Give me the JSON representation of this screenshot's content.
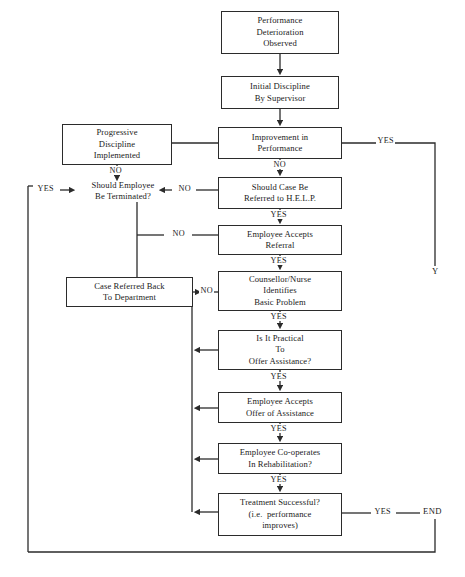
{
  "diagram": {
    "line_color": "#2b2b2b",
    "text_color": "#1a1a1a",
    "background": "#ffffff"
  },
  "nodes": [
    {
      "id": "performance-deterioration-observed",
      "lines": [
        "Performance",
        "Deterioration",
        "Observed"
      ],
      "x": 221,
      "y": 11,
      "w": 118,
      "h": 43,
      "boxed": true
    },
    {
      "id": "initial-discipline-by-supervisor",
      "lines": [
        "Initial Discipline",
        "By Supervisor"
      ],
      "x": 221,
      "y": 76,
      "w": 118,
      "h": 33,
      "boxed": true
    },
    {
      "id": "improvement-in-performance",
      "lines": [
        "Improvement in",
        "Performance"
      ],
      "x": 218,
      "y": 127,
      "w": 124,
      "h": 32,
      "boxed": true
    },
    {
      "id": "progressive-discipline-implemented",
      "lines": [
        "Progressive",
        "Discipline",
        "Implemented"
      ],
      "x": 62,
      "y": 124,
      "w": 110,
      "h": 41,
      "boxed": true
    },
    {
      "id": "should-employee-be-terminated",
      "lines": [
        "Should Employee",
        "Be Terminated?"
      ],
      "x": 73,
      "y": 180,
      "w": 100,
      "h": 22,
      "boxed": false
    },
    {
      "id": "should-case-be-referred-to-help",
      "lines": [
        "Should Case Be",
        "Referred to H.E.L.P."
      ],
      "x": 218,
      "y": 177,
      "w": 124,
      "h": 32,
      "boxed": true
    },
    {
      "id": "employee-accepts-referral",
      "lines": [
        "Employee Accepts",
        "Referral"
      ],
      "x": 218,
      "y": 225,
      "w": 124,
      "h": 30,
      "boxed": true
    },
    {
      "id": "counsellor-nurse-identifies-basic-problem",
      "lines": [
        "Counsellor/Nurse",
        "Identifies",
        "Basic Problem"
      ],
      "x": 218,
      "y": 271,
      "w": 124,
      "h": 40,
      "boxed": true
    },
    {
      "id": "case-referred-back-to-department",
      "lines": [
        "Case Referred Back",
        "To Department"
      ],
      "x": 66,
      "y": 277,
      "w": 127,
      "h": 30,
      "boxed": true
    },
    {
      "id": "is-it-practical-to-offer-assistance",
      "lines": [
        "Is It Practical",
        "To",
        "Offer Assistance?"
      ],
      "x": 218,
      "y": 330,
      "w": 124,
      "h": 40,
      "boxed": true
    },
    {
      "id": "employee-accepts-offer-of-assistance",
      "lines": [
        "Employee Accepts",
        "Offer of Assistance"
      ],
      "x": 218,
      "y": 392,
      "w": 124,
      "h": 31,
      "boxed": true
    },
    {
      "id": "employee-co-operates-in-rehabilitation",
      "lines": [
        "Employee Co-operates",
        "In Rehabilitation?"
      ],
      "x": 218,
      "y": 443,
      "w": 124,
      "h": 31,
      "boxed": true
    },
    {
      "id": "treatment-successful",
      "lines": [
        "Treatment Successful?",
        "(i.e.  performance",
        "improves)"
      ],
      "x": 218,
      "y": 493,
      "w": 124,
      "h": 43,
      "boxed": true
    }
  ],
  "edge_labels": [
    {
      "id": "improvement-yes",
      "text": "YES",
      "x": 376,
      "y": 136
    },
    {
      "id": "improvement-no",
      "text": "NO",
      "x": 272,
      "y": 160
    },
    {
      "id": "progressive-no",
      "text": "NO",
      "x": 130,
      "y": 166
    },
    {
      "id": "terminated-yes",
      "text": "YES",
      "x": 36,
      "y": 183
    },
    {
      "id": "help-no",
      "text": "NO",
      "x": 178,
      "y": 183
    },
    {
      "id": "help-yes",
      "text": "YES",
      "x": 269,
      "y": 211
    },
    {
      "id": "referral-no",
      "text": "NO",
      "x": 174,
      "y": 229
    },
    {
      "id": "referral-yes",
      "text": "YES",
      "x": 269,
      "y": 257
    },
    {
      "id": "counsellor-no",
      "text": "NO",
      "x": 203,
      "y": 285
    },
    {
      "id": "counsellor-yes",
      "text": "YES",
      "x": 269,
      "y": 313
    },
    {
      "id": "practical-yes",
      "text": "YES",
      "x": 269,
      "y": 373
    },
    {
      "id": "accepts-offer-yes",
      "text": "YES",
      "x": 269,
      "y": 425
    },
    {
      "id": "co-operates-yes",
      "text": "YES",
      "x": 269,
      "y": 476
    },
    {
      "id": "treatment-yes",
      "text": "YES",
      "x": 378,
      "y": 506
    },
    {
      "id": "return-path-y",
      "text": "Y",
      "x": 415,
      "y": 271
    },
    {
      "id": "end-terminal",
      "text": "END",
      "x": 424,
      "y": 506
    }
  ],
  "connectors": [
    {
      "id": "observed-to-initial",
      "kind": "arrow-down"
    },
    {
      "id": "initial-to-improvement",
      "kind": "arrow-down"
    },
    {
      "id": "improvement-yes-right",
      "kind": "line-right-down"
    },
    {
      "id": "improvement-no-down",
      "kind": "arrow-down"
    },
    {
      "id": "progressive-to-improvement",
      "kind": "line-right"
    },
    {
      "id": "progressive-no-down",
      "kind": "arrow-down"
    },
    {
      "id": "terminated-yes-left",
      "kind": "arrow-right"
    },
    {
      "id": "help-no-left",
      "kind": "arrow-left"
    },
    {
      "id": "help-yes-down",
      "kind": "arrow-down"
    },
    {
      "id": "referral-no-left",
      "kind": "line-left"
    },
    {
      "id": "referral-yes-down",
      "kind": "arrow-down"
    },
    {
      "id": "counsellor-no-left",
      "kind": "arrow-left"
    },
    {
      "id": "counsellor-yes-down",
      "kind": "arrow-down"
    },
    {
      "id": "practical-no-left",
      "kind": "arrow-left"
    },
    {
      "id": "practical-yes-down",
      "kind": "arrow-down"
    },
    {
      "id": "accepts-offer-no-left",
      "kind": "arrow-left"
    },
    {
      "id": "accepts-offer-yes-down",
      "kind": "arrow-down"
    },
    {
      "id": "co-operates-no-left",
      "kind": "arrow-left"
    },
    {
      "id": "co-operates-yes-down",
      "kind": "arrow-down"
    },
    {
      "id": "treatment-no-left",
      "kind": "arrow-left"
    },
    {
      "id": "treatment-yes-end",
      "kind": "line-right"
    },
    {
      "id": "end-return-bottom",
      "kind": "line-loop-bottom"
    },
    {
      "id": "terminated-left-loop",
      "kind": "line-loop-left"
    }
  ]
}
